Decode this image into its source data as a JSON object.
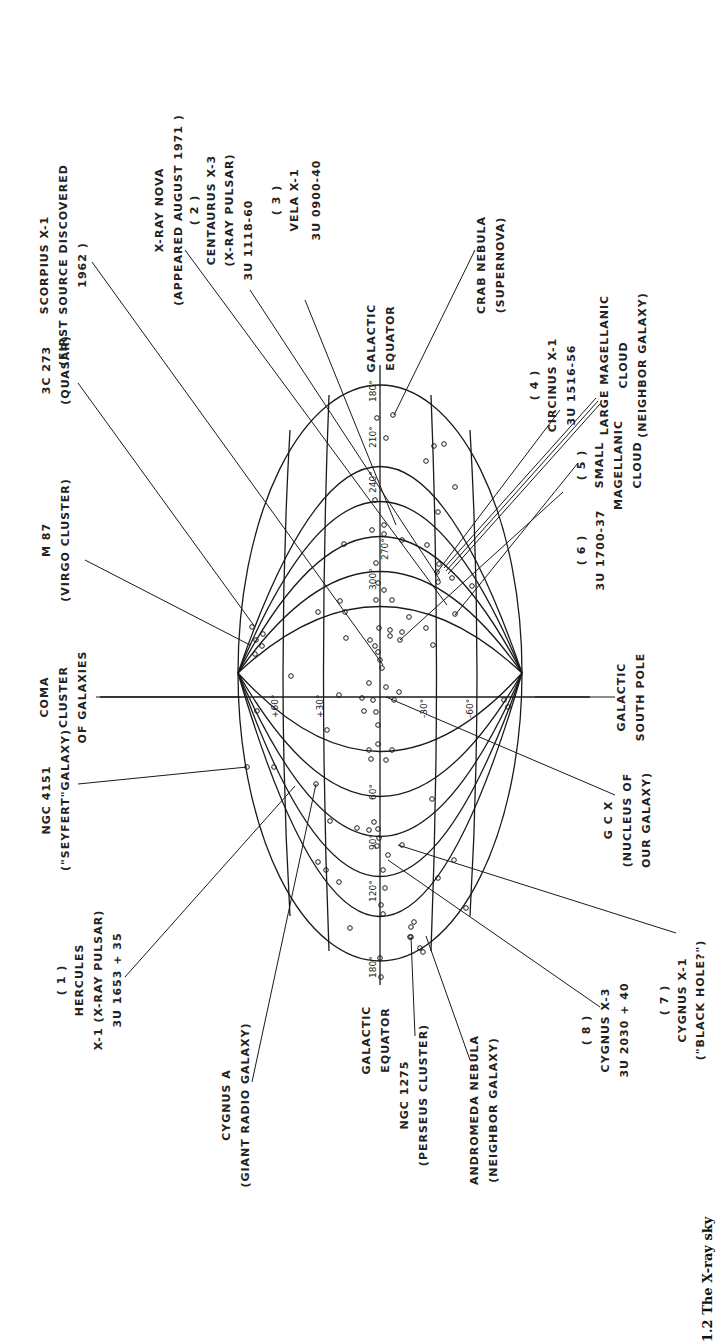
{
  "figure": {
    "caption_fragment": "1.2 The X-ray sky",
    "orientation": "rotated 90 degrees counter-clockwise"
  },
  "axes": {
    "equator_label_top": [
      "GALACTIC",
      "EQUATOR"
    ],
    "equator_label_bottom": [
      "GALACTIC",
      "EQUATOR"
    ],
    "longitude_ticks": [
      "180°",
      "210°",
      "240°",
      "270°",
      "300°",
      "60°",
      "90°",
      "120°",
      "180°"
    ],
    "latitude_ticks": [
      "+60°",
      "+30°",
      "-30°",
      "-60°"
    ],
    "north_pole_label": [
      "COMA",
      "CLUSTER",
      "OF GALAXIES"
    ],
    "south_pole_label": [
      "GALACTIC",
      "SOUTH POLE"
    ]
  },
  "labels": {
    "scorpius": [
      "SCORPIUS X-1",
      "(FIRST SOURCE DISCOVERED",
      "1962 )"
    ],
    "xray_nova": [
      "X-RAY NOVA",
      "(APPEARED AUGUST 1971 )"
    ],
    "centaurus": [
      "( 2 )",
      "CENTAURUS X-3",
      "(X-RAY PULSAR)",
      "3U 1118-60"
    ],
    "vela": [
      "( 3 )",
      "VELA X-1",
      "3U 0900-40"
    ],
    "crab": [
      "CRAB NEBULA",
      "(SUPERNOVA)"
    ],
    "quasar": [
      "3C 273",
      "(QUASAR)"
    ],
    "circinus": [
      "( 4 )",
      "CIRCINUS X-1",
      "3U 1516-56"
    ],
    "lmc": [
      "LARGE MAGELLANIC",
      "CLOUD",
      "(NEIGHBOR GALAXY)"
    ],
    "m87": [
      "M 87",
      "(VIRGO CLUSTER)"
    ],
    "smc": [
      "( 5 )",
      "SMALL",
      "MAGELLANIC",
      "CLOUD"
    ],
    "u1700": [
      "( 6 )",
      "3U 1700-37"
    ],
    "ngc4151": [
      "NGC 4151",
      "(\"SEYFERT\"GALAXY)"
    ],
    "gcx": [
      "G C X",
      "(NUCLEUS OF",
      "OUR GALAXY)"
    ],
    "hercules": [
      "( 1 )",
      "HERCULES",
      "X-1 (X-RAY PULSAR)",
      "3U 1653 + 35"
    ],
    "cygnus_x1": [
      "( 7 )",
      "CYGNUS X-1",
      "(\"BLACK HOLE?\")"
    ],
    "cygnus_a": [
      "CYGNUS A",
      "(GIANT RADIO GALAXY)"
    ],
    "ngc1275": [
      "NGC 1275",
      "(PERSEUS CLUSTER)"
    ],
    "andromeda": [
      "ANDROMEDA NEBULA",
      "(NEIGHBOR GALAXY)"
    ],
    "cygnus_x3": [
      "( 8 )",
      "CYGNUS X-3",
      "3U 2030 + 40"
    ]
  }
}
